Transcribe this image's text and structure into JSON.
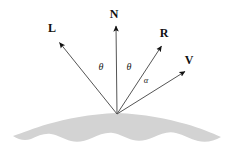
{
  "figure": {
    "background_color": "#ffffff",
    "line_color": "#555555",
    "arrowhead_color": "#111111",
    "surface_fill": "#d3d3d3",
    "label_color": "#111111"
  },
  "origin": {
    "x": 117,
    "y": 114
  },
  "vectors": [
    {
      "id": "L",
      "label": "L",
      "label_x": 52,
      "label_y": 32,
      "tip_x": 57,
      "tip_y": 40,
      "tail_x": 117,
      "tail_y": 114,
      "meaning": "light-direction-vector"
    },
    {
      "id": "N",
      "label": "N",
      "label_x": 114,
      "label_y": 18,
      "tip_x": 116,
      "tip_y": 23,
      "tail_x": 117,
      "tail_y": 114,
      "meaning": "surface-normal-vector"
    },
    {
      "id": "R",
      "label": "R",
      "label_x": 164,
      "label_y": 37,
      "tip_x": 164,
      "tip_y": 43,
      "tail_x": 117,
      "tail_y": 114,
      "meaning": "reflection-vector"
    },
    {
      "id": "V",
      "label": "V",
      "label_x": 189,
      "label_y": 64,
      "tip_x": 188,
      "tip_y": 69,
      "tail_x": 117,
      "tail_y": 114,
      "meaning": "view-direction-vector"
    }
  ],
  "angles": [
    {
      "id": "theta-left",
      "label": "θ",
      "x": 101,
      "y": 70,
      "between": [
        "L",
        "N"
      ],
      "meaning": "incidence-angle"
    },
    {
      "id": "theta-right",
      "label": "θ",
      "x": 129,
      "y": 70,
      "between": [
        "N",
        "R"
      ],
      "meaning": "reflection-angle"
    },
    {
      "id": "alpha",
      "label": "α",
      "x": 145,
      "y": 83,
      "between": [
        "R",
        "V"
      ],
      "meaning": "specular-falloff-angle"
    }
  ],
  "surface": {
    "name": "shaded-surface-mound",
    "fill": "#d3d3d3",
    "left_tip_x": 12,
    "right_tip_x": 222,
    "apex_x": 117,
    "apex_y": 113,
    "path": "M 13 136 C 22 133 34 128 48 124 C 66 119 90 114 117 113 C 144 114 168 119 186 124 C 200 128 212 133 221 137 C 214 141 206 143 198 141 C 190 139 184 135 176 133 C 168 131 161 134 154 137 C 147 140 140 142 133 140 C 126 138 120 134 113 133 C 106 132 99 135 92 138 C 85 141 78 143 71 141 C 64 139 58 135 51 134 C 44 133 38 136 31 139 C 25 141 19 140 13 136 Z"
  }
}
